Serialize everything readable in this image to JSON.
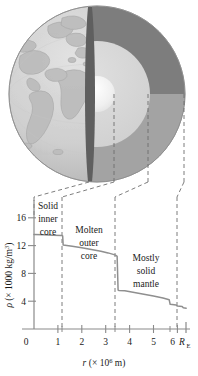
{
  "figure": {
    "name": "earth-density-profile",
    "colors": {
      "globe_surface": "#cfcfcf",
      "continent": "#bcbcbc",
      "inner_core": "#f3f3f3",
      "outer_core": "#d6d6d6",
      "upper_mantle_dark": "#7d7d7d",
      "lower_mantle_mid": "#a3a3a3",
      "crust_edge": "#6a6a6a",
      "curve": "#8a8a8a",
      "axis": "#8a8a8a",
      "dashes": "#6e6e6e",
      "text": "#1a1a1a"
    }
  },
  "diagram": {
    "name": "earth-cutaway",
    "layers": [
      {
        "name": "solid-inner-core",
        "color": "#f3f3f3"
      },
      {
        "name": "molten-outer-core",
        "color": "#d6d6d6"
      },
      {
        "name": "mostly-solid-mantle-upper",
        "color": "#7d7d7d"
      },
      {
        "name": "mostly-solid-mantle-lower",
        "color": "#a3a3a3"
      },
      {
        "name": "globe-surface",
        "color": "#cfcfcf"
      }
    ],
    "leader_lines": 4
  },
  "chart_data": {
    "type": "line",
    "title": "",
    "xlabel": "r (× 10⁶ m)",
    "ylabel": "ρ (× 1000 kg/m³)",
    "xlabel_parts": {
      "sym": "r",
      "open": "(× 10",
      "exp": "6",
      "close": " m)"
    },
    "ylabel_parts": {
      "sym": "ρ",
      "open": "(× 1000 kg/m",
      "exp": "3",
      "close": ")"
    },
    "xlim": [
      0,
      6.37
    ],
    "ylim": [
      0,
      18
    ],
    "grid": false,
    "legend": "none",
    "x_ticks": [
      0,
      1,
      2,
      3,
      4,
      5,
      6
    ],
    "x_tick_labels": [
      "0",
      "1",
      "2",
      "3",
      "4",
      "5",
      "6"
    ],
    "x_end_label": "R",
    "x_end_sub": "E",
    "x_end_value": 6.37,
    "x_minor_ticks": [
      1.2,
      3.5,
      3.5,
      5.7
    ],
    "y_ticks": [
      4,
      8,
      12,
      16
    ],
    "y_tick_labels": [
      "4",
      "8",
      "12",
      "16"
    ],
    "x": [
      0.0,
      0.4,
      0.8,
      1.16,
      1.2,
      1.22,
      1.6,
      2.0,
      2.4,
      2.8,
      3.1,
      3.35,
      3.45,
      3.48,
      3.52,
      3.56,
      3.8,
      4.2,
      4.6,
      5.0,
      5.4,
      5.66,
      5.7,
      5.95,
      6.0,
      6.2,
      6.25,
      6.37
    ],
    "y": [
      13.6,
      13.55,
      13.5,
      13.45,
      13.4,
      12.1,
      11.9,
      11.7,
      11.45,
      11.2,
      10.95,
      10.7,
      10.55,
      10.45,
      5.6,
      5.55,
      5.5,
      5.25,
      5.0,
      4.75,
      4.45,
      4.2,
      3.55,
      3.45,
      3.3,
      3.25,
      3.05,
      3.0
    ],
    "series": [
      {
        "name": "density",
        "points": [
          [
            0.0,
            13.6
          ],
          [
            0.4,
            13.55
          ],
          [
            0.8,
            13.5
          ],
          [
            1.16,
            13.45
          ],
          [
            1.2,
            13.4
          ],
          [
            1.22,
            12.1
          ],
          [
            1.6,
            11.9
          ],
          [
            2.0,
            11.7
          ],
          [
            2.4,
            11.45
          ],
          [
            2.8,
            11.2
          ],
          [
            3.1,
            10.95
          ],
          [
            3.35,
            10.7
          ],
          [
            3.45,
            10.55
          ],
          [
            3.48,
            10.45
          ],
          [
            3.52,
            5.6
          ],
          [
            3.56,
            5.55
          ],
          [
            3.8,
            5.5
          ],
          [
            4.2,
            5.25
          ],
          [
            4.6,
            5.0
          ],
          [
            5.0,
            4.75
          ],
          [
            5.4,
            4.45
          ],
          [
            5.66,
            4.2
          ],
          [
            5.7,
            3.55
          ],
          [
            5.95,
            3.45
          ],
          [
            6.0,
            3.3
          ],
          [
            6.2,
            3.25
          ],
          [
            6.25,
            3.05
          ],
          [
            6.37,
            3.0
          ]
        ]
      }
    ],
    "annotations": [
      {
        "name": "solid-inner-core-label",
        "lines": [
          "Solid",
          "inner",
          "core"
        ],
        "x_range": [
          0.0,
          1.2
        ]
      },
      {
        "name": "molten-outer-core-label",
        "lines": [
          "Molten",
          "outer",
          "core"
        ],
        "x_range": [
          1.2,
          3.5
        ]
      },
      {
        "name": "mostly-solid-mantle-label",
        "lines": [
          "Mostly",
          "solid",
          "mantle"
        ],
        "x_range": [
          3.5,
          6.37
        ]
      }
    ],
    "boundaries": [
      1.2,
      3.5,
      6.37
    ]
  },
  "labels": {
    "region1_l1": "Solid",
    "region1_l2": "inner",
    "region1_l3": "core",
    "region2_l1": "Molten",
    "region2_l2": "outer",
    "region2_l3": "core",
    "region3_l1": "Mostly",
    "region3_l2": "solid",
    "region3_l3": "mantle",
    "y0": "0",
    "y4": "4",
    "y8": "8",
    "y12": "12",
    "y16": "16",
    "x0": "0",
    "x1": "1",
    "x2": "2",
    "x3": "3",
    "x4": "4",
    "x5": "5",
    "x6": "6",
    "xRE_main": "R",
    "xRE_sub": "E",
    "ysym": "ρ",
    "yopen": "(× 1000 kg/m",
    "yexp": "3",
    "yclose": ")",
    "xsym": "r",
    "xopen": "(× 10",
    "xexp": "6",
    "xclose": " m)"
  }
}
